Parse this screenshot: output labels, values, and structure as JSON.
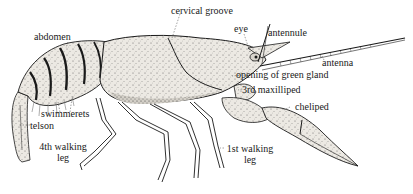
{
  "diagram": {
    "labels": {
      "cervical_groove": "cervical groove",
      "eye": "eye",
      "antennule": "antennule",
      "abdomen": "abdomen",
      "antenna": "antenna",
      "opening_of_green_gland": "opening of green gland",
      "third_maxilliped": "3rd maxilliped",
      "cheliped": "cheliped",
      "swimmerets": "swimmerets",
      "telson": "telson",
      "fourth_walking_leg_line1": "4th walking",
      "fourth_walking_leg_line2": "leg",
      "first_walking_leg_line1": "1st walking",
      "first_walking_leg_line2": "leg"
    },
    "colors": {
      "ink": "#1a1a1a",
      "shell_fill": "#e9e6e0",
      "shade": "#bdb8ae",
      "background": "#ffffff"
    }
  }
}
